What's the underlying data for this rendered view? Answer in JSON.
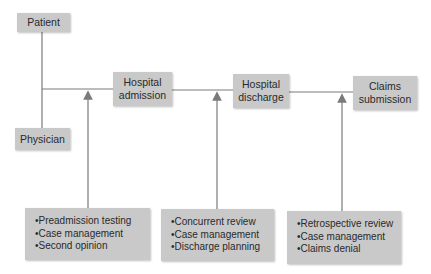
{
  "diagram": {
    "actors": [
      {
        "label": "Patient"
      },
      {
        "label": "Physician"
      }
    ],
    "stages": [
      {
        "label_line1": "Hospital",
        "label_line2": "admission"
      },
      {
        "label_line1": "Hospital",
        "label_line2": "discharge"
      },
      {
        "label_line1": "Claims",
        "label_line2": "submission"
      }
    ],
    "activities": [
      {
        "items": [
          "•Preadmission testing",
          "•Case management",
          "•Second opinion"
        ]
      },
      {
        "items": [
          "•Concurrent review",
          "•Case management",
          "•Discharge planning"
        ]
      },
      {
        "items": [
          "•Retrospective review",
          "•Case management",
          "•Claims denial"
        ]
      }
    ],
    "colors": {
      "box": "#c9c9c9",
      "line": "#7a7a7a"
    }
  }
}
